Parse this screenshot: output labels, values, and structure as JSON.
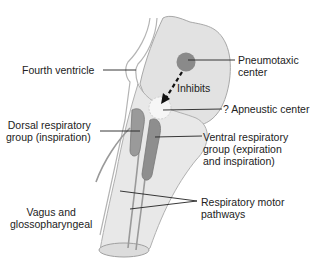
{
  "diagram": {
    "colors": {
      "brainstem_fill": "#e6e6e6",
      "brainstem_stroke": "#b4b4b4",
      "pons_fill": "#e2e2e2",
      "center_dark": "#8a8a8a",
      "apneustic_fill": "#f6f6f6",
      "line": "#222222",
      "text": "#222222"
    },
    "labels": {
      "fourth_ventricle": "Fourth ventricle",
      "pneumotaxic": [
        "Pneumotaxic",
        "center"
      ],
      "inhibits": "Inhibits",
      "apneustic": "? Apneustic center",
      "dorsal": [
        "Dorsal respiratory",
        "group (inspiration)"
      ],
      "ventral": [
        "Ventral respiratory",
        "group (expiration",
        "and inspiration)"
      ],
      "vagus": [
        "Vagus and",
        "glossopharyngeal"
      ],
      "motor": [
        "Respiratory motor",
        "pathways"
      ]
    }
  }
}
